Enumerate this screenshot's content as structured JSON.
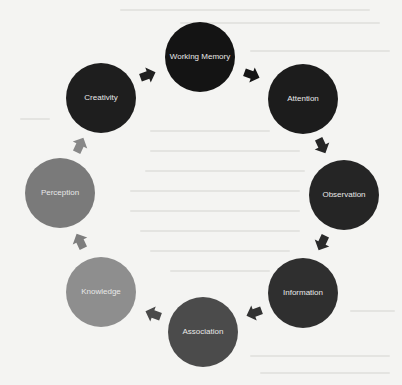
{
  "diagram": {
    "type": "cycle",
    "nodes": [
      {
        "id": "working-memory",
        "label": "Working Memory",
        "cx": 200,
        "cy": 57,
        "color": "#141414"
      },
      {
        "id": "attention",
        "label": "Attention",
        "cx": 303,
        "cy": 99,
        "color": "#1c1c1c"
      },
      {
        "id": "observation",
        "label": "Observation",
        "cx": 344,
        "cy": 195,
        "color": "#252525"
      },
      {
        "id": "information",
        "label": "Information",
        "cx": 303,
        "cy": 293,
        "color": "#2f2f2f"
      },
      {
        "id": "association",
        "label": "Association",
        "cx": 203,
        "cy": 332,
        "color": "#4b4b4b"
      },
      {
        "id": "knowledge",
        "label": "Knowledge",
        "cx": 101,
        "cy": 292,
        "color": "#8e8e8e"
      },
      {
        "id": "perception",
        "label": "Perception",
        "cx": 60,
        "cy": 193,
        "color": "#7a7a7a"
      },
      {
        "id": "creativity",
        "label": "Creativity",
        "cx": 101,
        "cy": 98,
        "color": "#1e1e1e"
      }
    ],
    "edges": [
      {
        "from": "creativity",
        "to": "working-memory",
        "x": 148,
        "y": 75,
        "angle": -20,
        "color": "#202020"
      },
      {
        "from": "working-memory",
        "to": "attention",
        "x": 252,
        "y": 75,
        "angle": 20,
        "color": "#151515"
      },
      {
        "from": "attention",
        "to": "observation",
        "x": 322,
        "y": 146,
        "angle": 65,
        "color": "#262626"
      },
      {
        "from": "observation",
        "to": "information",
        "x": 322,
        "y": 243,
        "angle": 115,
        "color": "#2a2a2a"
      },
      {
        "from": "information",
        "to": "association",
        "x": 254,
        "y": 313,
        "angle": 160,
        "color": "#333333"
      },
      {
        "from": "association",
        "to": "knowledge",
        "x": 153,
        "y": 314,
        "angle": 200,
        "color": "#4a4a4a"
      },
      {
        "from": "knowledge",
        "to": "perception",
        "x": 80,
        "y": 241,
        "angle": 245,
        "color": "#7e7e7e"
      },
      {
        "from": "perception",
        "to": "creativity",
        "x": 80,
        "y": 145,
        "angle": 295,
        "color": "#888888"
      }
    ]
  }
}
